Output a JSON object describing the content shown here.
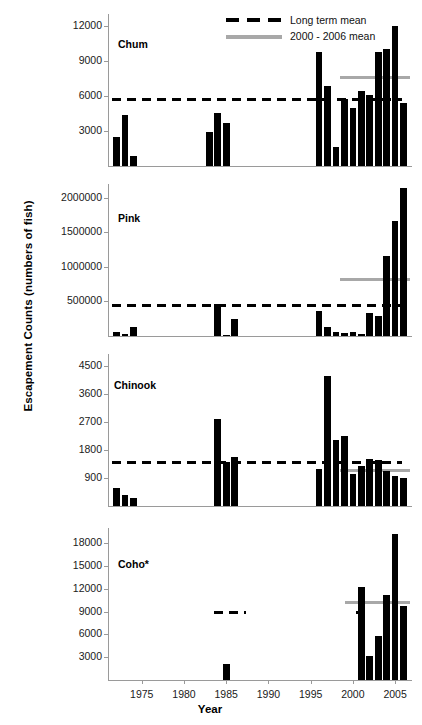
{
  "figure": {
    "ylabel": "Escapement Counts (numbers of fish)",
    "xlabel": "Year"
  },
  "legend": {
    "position": "top-center",
    "items": [
      {
        "label": "Long term mean",
        "style": "dashed",
        "color": "#000000"
      },
      {
        "label": "2000 - 2006 mean",
        "style": "solid",
        "color": "#a8a8a8"
      }
    ]
  },
  "xaxis": {
    "ticks": [
      "1975",
      "1980",
      "1985",
      "1990",
      "1995",
      "2000",
      "2005"
    ],
    "tick_values": [
      1975,
      1980,
      1985,
      1990,
      1995,
      2000,
      2005
    ],
    "min": 1971,
    "max": 2007
  },
  "chart_data": [
    {
      "type": "bar",
      "title": "Chum",
      "xlabel": "Year",
      "ylabel": "Escapement Counts (numbers of fish)",
      "ylim": [
        0,
        13000
      ],
      "yticks": [
        3000,
        6000,
        9000,
        12000
      ],
      "ytick_labels": [
        "3000",
        "6000",
        "9000",
        "12000"
      ],
      "grid": false,
      "x": [
        1972,
        1973,
        1974,
        1983,
        1984,
        1985,
        1996,
        1997,
        1998,
        1999,
        2000,
        2001,
        2002,
        2003,
        2004,
        2005,
        2006
      ],
      "values": [
        2450,
        4350,
        850,
        2950,
        4500,
        3700,
        9750,
        6800,
        1600,
        5700,
        4950,
        6450,
        6050,
        9750,
        10000,
        11950,
        5350
      ],
      "long_term_mean": 5700,
      "mean_2000_2006": 7750
    },
    {
      "type": "bar",
      "title": "Pink",
      "xlabel": "Year",
      "ylabel": "Escapement Counts (numbers of fish)",
      "ylim": [
        0,
        2200000
      ],
      "yticks": [
        500000,
        1000000,
        1500000,
        2000000
      ],
      "ytick_labels": [
        "500000",
        "1000000",
        "1500000",
        "2000000"
      ],
      "grid": false,
      "x": [
        1972,
        1973,
        1974,
        1984,
        1985,
        1986,
        1996,
        1997,
        1998,
        1999,
        2000,
        2001,
        2002,
        2003,
        2004,
        2005,
        2006
      ],
      "values": [
        55000,
        30000,
        130000,
        460000,
        10000,
        240000,
        355000,
        135000,
        60000,
        45000,
        60000,
        25000,
        335000,
        290000,
        1165000,
        1665000,
        2145000
      ],
      "long_term_mean": 430000,
      "mean_2000_2006": 810000
    },
    {
      "type": "bar",
      "title": "Chinook",
      "xlabel": "Year",
      "ylabel": "Escapement Counts (numbers of fish)",
      "ylim": [
        0,
        4900
      ],
      "yticks": [
        900,
        1800,
        2700,
        3600,
        4500
      ],
      "ytick_labels": [
        "900",
        "1800",
        "2700",
        "3600",
        "4500"
      ],
      "grid": false,
      "x": [
        1972,
        1973,
        1974,
        1984,
        1985,
        1986,
        1996,
        1997,
        1998,
        1999,
        2000,
        2001,
        2002,
        2003,
        2004,
        2005,
        2006
      ],
      "values": [
        590,
        350,
        250,
        2820,
        1430,
        1570,
        1180,
        4180,
        2120,
        2250,
        1040,
        1290,
        1530,
        1490,
        1140,
        980,
        890
      ],
      "long_term_mean": 1430,
      "mean_2000_2006": 1180
    },
    {
      "type": "bar",
      "title": "Coho*",
      "xlabel": "Year",
      "ylabel": "Escapement Counts (numbers of fish)",
      "ylim": [
        0,
        20000
      ],
      "yticks": [
        3000,
        6000,
        9000,
        12000,
        15000,
        18000
      ],
      "ytick_labels": [
        "3000",
        "6000",
        "9000",
        "12000",
        "15000",
        "18000"
      ],
      "grid": false,
      "x": [
        1985,
        2001,
        2002,
        2003,
        2004,
        2005,
        2006
      ],
      "values": [
        2100,
        12250,
        3100,
        5850,
        11150,
        19150,
        9800
      ],
      "long_term_mean": 9100,
      "mean_2000_2006": 10350
    }
  ]
}
